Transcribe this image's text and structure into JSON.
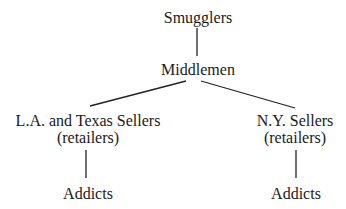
{
  "diagram": {
    "type": "hierarchy",
    "nodes": {
      "smugglers": {
        "label": "Smugglers"
      },
      "middlemen": {
        "label": "Middlemen"
      },
      "la_texas_sellers": {
        "label": "L.A. and Texas Sellers",
        "sublabel": "(retailers)"
      },
      "ny_sellers": {
        "label": "N.Y. Sellers",
        "sublabel": "(retailers)"
      },
      "addicts_left": {
        "label": "Addicts"
      },
      "addicts_right": {
        "label": "Addicts"
      }
    },
    "edges": [
      {
        "from": "smugglers",
        "to": "middlemen"
      },
      {
        "from": "middlemen",
        "to": "la_texas_sellers"
      },
      {
        "from": "middlemen",
        "to": "ny_sellers"
      },
      {
        "from": "la_texas_sellers",
        "to": "addicts_left"
      },
      {
        "from": "ny_sellers",
        "to": "addicts_right"
      }
    ],
    "colors": {
      "line": "#222222",
      "text": "#1a1a1a",
      "background": "#ffffff"
    }
  }
}
